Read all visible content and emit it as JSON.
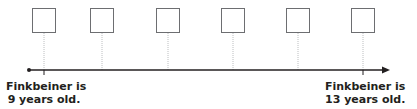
{
  "timeline": {
    "boxes": [
      {
        "x": 44,
        "value": ""
      },
      {
        "x": 102,
        "value": ""
      },
      {
        "x": 168,
        "value": ""
      },
      {
        "x": 233,
        "value": ""
      },
      {
        "x": 298,
        "value": ""
      },
      {
        "x": 363,
        "value": ""
      }
    ],
    "start_label": {
      "line1": "Finkbeiner is",
      "line2": "9 years old."
    },
    "end_label": {
      "line1": "Finkbeiner is",
      "line2": "13 years old."
    },
    "colors": {
      "line": "#231f20",
      "box": "#6d6e71",
      "connector": "#bcbec0"
    }
  }
}
